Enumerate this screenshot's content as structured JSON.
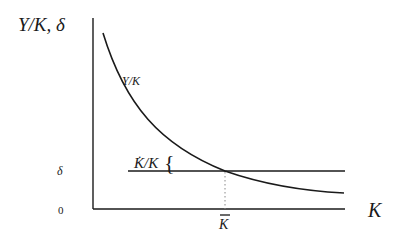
{
  "diagram": {
    "y_axis_label": "Y/K, δ",
    "x_axis_label": "K",
    "curve_label": "Y/K",
    "growth_label": "K̇/K",
    "brace": "{",
    "delta_tick": "δ",
    "zero_tick": "0",
    "kbar_tick": "K̄",
    "colors": {
      "line": "#1a1a1a",
      "dotted": "#888888",
      "background": "#ffffff"
    }
  }
}
